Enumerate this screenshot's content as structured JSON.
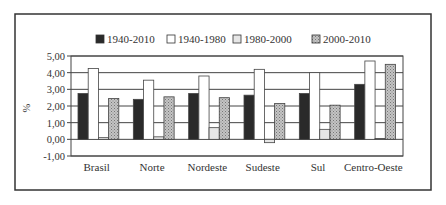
{
  "chart_data": {
    "type": "bar",
    "title": "",
    "xlabel": "",
    "ylabel": "%",
    "ylim": [
      -1,
      5
    ],
    "yticks": [
      "5,00",
      "4,00",
      "3,00",
      "2,00",
      "1,00",
      "0,00",
      "-1,00"
    ],
    "ytick_values": [
      5,
      4,
      3,
      2,
      1,
      0,
      -1
    ],
    "grid": true,
    "legend_position": "top",
    "categories": [
      "Brasil",
      "Norte",
      "Nordeste",
      "Sudeste",
      "Sul",
      "Centro-Oeste"
    ],
    "series": [
      {
        "name": "1940-2010",
        "style": "black",
        "values": [
          2.75,
          2.4,
          2.75,
          2.65,
          2.75,
          3.3
        ]
      },
      {
        "name": "1940-1980",
        "style": "white",
        "values": [
          4.25,
          3.55,
          3.8,
          4.2,
          4.0,
          4.7
        ]
      },
      {
        "name": "1980-2000",
        "style": "light",
        "values": [
          0.1,
          0.15,
          0.7,
          -0.2,
          0.6,
          0.05
        ]
      },
      {
        "name": "2000-2010",
        "style": "dotted",
        "values": [
          2.45,
          2.55,
          2.5,
          2.15,
          2.05,
          4.5
        ]
      }
    ]
  },
  "colors": {
    "black": "#2a2a2a",
    "white": "#ffffff",
    "light": "#e6e6e6",
    "dotted": "#b0b0b0",
    "frame": "#333333"
  }
}
